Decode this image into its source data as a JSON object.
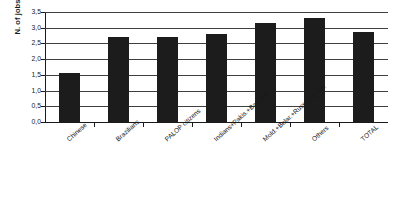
{
  "chart_data": {
    "type": "bar",
    "title": "",
    "xlabel": "",
    "ylabel": "N. of jobs",
    "ylim": [
      0.0,
      3.5
    ],
    "ytick_labels": [
      "3,5",
      "3,0",
      "2,5",
      "2,0",
      "1,5",
      "1,0",
      "0,5",
      "0,0"
    ],
    "ytick_values": [
      3.5,
      3.0,
      2.5,
      2.0,
      1.5,
      1.0,
      0.5,
      0.0
    ],
    "grid": true,
    "legend": "none",
    "bar_color": "#1c1c1c",
    "categories": [
      "Chinese",
      "Brazilians",
      "PALOP citizens",
      "Indians+Pakis.+Banglad.",
      "Mold.+Belar.+Russ.+Ucrain.",
      "Others",
      "TOTAL"
    ],
    "values": [
      1.55,
      2.7,
      2.7,
      2.8,
      3.15,
      3.3,
      2.85
    ]
  }
}
